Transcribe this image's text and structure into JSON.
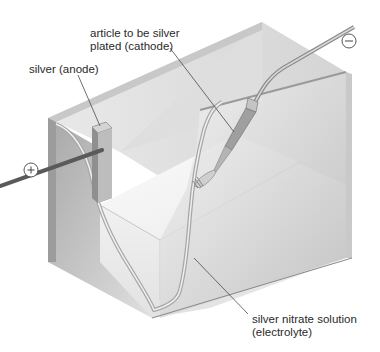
{
  "diagram": {
    "type": "electroplating-cell",
    "labels": {
      "cathode_line1": "article to be silver",
      "cathode_line2": "plated (cathode)",
      "anode": "silver (anode)",
      "electrolyte_line1": "silver nitrate solution",
      "electrolyte_line2": "(electrolyte)"
    },
    "terminals": {
      "positive": "+",
      "negative": "−"
    },
    "components": [
      {
        "name": "tank",
        "description": "rectangular glass container cut away"
      },
      {
        "name": "anode",
        "description": "silver block on left wall",
        "terminal": "+"
      },
      {
        "name": "cathode",
        "description": "fork held by wire",
        "terminal": "−"
      },
      {
        "name": "electrolyte",
        "description": "silver nitrate solution filling tank"
      }
    ],
    "colors": {
      "tank_dark": "#8c8c8c",
      "tank_mid": "#b8b8b8",
      "tank_light": "#e6e6e6",
      "rod": "#5a5a5a",
      "text": "#2a2a2a"
    }
  }
}
